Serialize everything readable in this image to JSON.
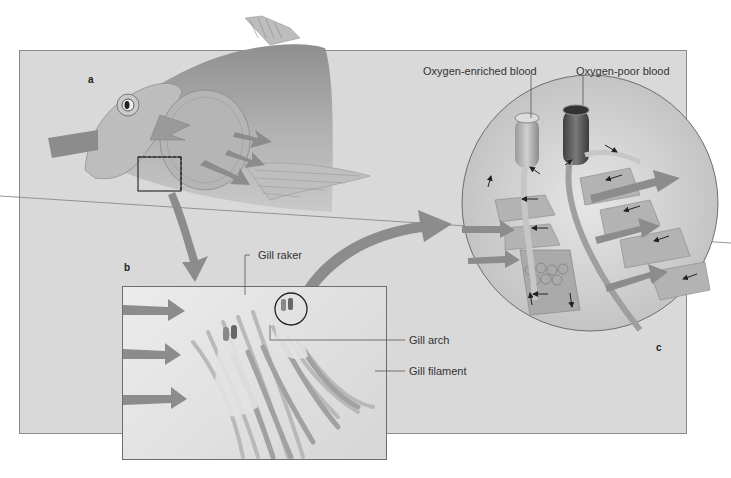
{
  "figure": {
    "panel_letters": {
      "a": "a",
      "b": "b",
      "c": "c"
    },
    "labels": {
      "oxygen_enriched": "Oxygen-enriched blood",
      "oxygen_poor": "Oxygen-poor blood",
      "gill_raker": "Gill raker",
      "gill_arch": "Gill arch",
      "gill_filament": "Gill filament"
    },
    "colors": {
      "background_panel": "#d9d9d9",
      "fish_body": "#a8a8a8",
      "arrow": "#8c8c8c",
      "vessel_light": "#b8b8b8",
      "vessel_dark": "#5e5e5e",
      "border": "#6d6d6d"
    }
  }
}
